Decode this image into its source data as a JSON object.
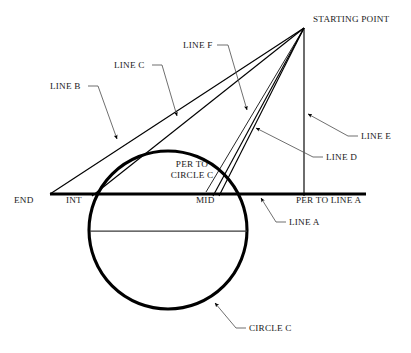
{
  "diagram": {
    "type": "geometric-construction",
    "background_color": "#ffffff",
    "stroke_color": "#000000",
    "leader_color": "#555555",
    "labels": {
      "starting_point": "STARTING POINT",
      "line_a": "LINE A",
      "line_b": "LINE B",
      "line_c": "LINE C",
      "line_d": "LINE D",
      "line_e": "LINE E",
      "line_f": "LINE F",
      "circle_c": "CIRCLE C",
      "per_to_line_a": "PER TO LINE A",
      "per_to_circle_c_1": "PER TO",
      "per_to_circle_c_2": "CIRCLE C",
      "end": "END",
      "int": "INT",
      "mid": "MID"
    },
    "geometry": {
      "starting_point": {
        "x": 304,
        "y": 28
      },
      "baseline": {
        "x1": 50,
        "y1": 194,
        "x2": 366,
        "y2": 194
      },
      "circle": {
        "cx": 168,
        "cy": 230,
        "r": 79
      },
      "chord": {
        "x1": 91,
        "y1": 231,
        "x2": 246,
        "y2": 231
      },
      "int_point": {
        "x": 94,
        "y": 194
      },
      "mid_point": {
        "x": 216,
        "y": 194
      },
      "end_point": {
        "x": 50,
        "y": 194
      },
      "per_foot": {
        "x": 304,
        "y": 194
      }
    }
  }
}
